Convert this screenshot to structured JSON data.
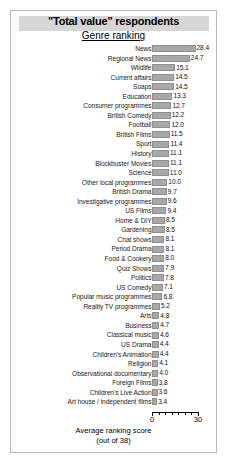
{
  "chart_data": {
    "type": "bar",
    "orientation": "horizontal",
    "title": "\"Total value\" respondents",
    "subtitle": "Genre ranking",
    "xlabel_line1": "Average ranking score",
    "xlabel_line2": "(out of 38)",
    "ylabel": "",
    "xlim": [
      0,
      30
    ],
    "xticks": [
      0,
      30
    ],
    "xticklabels": [
      "0",
      "30"
    ],
    "minor_tick_count": 6,
    "grid": false,
    "legend": false,
    "bar_color": "#a8a8a8",
    "categories": [
      "News",
      "Regional News",
      "Wildlife",
      "Current affairs",
      "Soaps",
      "Education",
      "Consumer programmes",
      "British Comedy",
      "Football",
      "British Films",
      "Sport",
      "History",
      "Blockbuster Movies",
      "Science",
      "Other local programmes",
      "British Drama",
      "Investigative programmes",
      "US Films",
      "Home & DIY",
      "Gardening",
      "Chat shows",
      "Period Drama",
      "Food & Cookery",
      "Quiz Shows",
      "Politics",
      "US Comedy",
      "Popular music programmes",
      "Reality TV programmes",
      "Arts",
      "Business",
      "Classical music",
      "US Drama",
      "Children's Animation",
      "Religion",
      "Observational documentary",
      "Foreign Films",
      "Children's Live Action",
      "Art house / independent films"
    ],
    "values": [
      28.4,
      24.7,
      15.1,
      14.5,
      14.5,
      13.3,
      12.7,
      12.2,
      12.0,
      11.5,
      11.4,
      11.1,
      11.1,
      11.0,
      10.0,
      9.7,
      9.6,
      9.4,
      8.5,
      8.5,
      8.1,
      8.1,
      8.0,
      7.9,
      7.8,
      7.1,
      6.8,
      5.2,
      4.8,
      4.7,
      4.6,
      4.4,
      4.4,
      4.1,
      4.0,
      3.8,
      3.6,
      3.4
    ],
    "value_labels": [
      "28.4",
      "24.7",
      "15.1",
      "14.5",
      "14.5",
      "13.3",
      "12.7",
      "12.2",
      "12.0",
      "11.5",
      "11.4",
      "11.1",
      "11.1",
      "11.0",
      "10.0",
      "9.7",
      "9.6",
      "9.4",
      "8.5",
      "8.5",
      "8.1",
      "8.1",
      "8.0",
      "7.9",
      "7.8",
      "7.1",
      "6.8",
      "5.2",
      "4.8",
      "4.7",
      "4.6",
      "4.4",
      "4.4",
      "4.1",
      "4.0",
      "3.8",
      "3.6",
      "3.4"
    ]
  }
}
